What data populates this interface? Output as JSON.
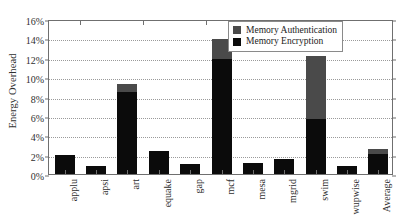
{
  "chart_data": {
    "type": "bar",
    "subtype": "stacked-bar",
    "title": "",
    "xlabel": "",
    "ylabel": "Energy Overhead",
    "categories": [
      "applu",
      "apsi",
      "art",
      "equake",
      "gap",
      "mcf",
      "mesa",
      "mgrid",
      "swim",
      "wupwise",
      "Average"
    ],
    "series": [
      {
        "name": "Memory Encryption",
        "color": "#0b0b0b",
        "values": [
          2.0,
          0.8,
          8.5,
          2.4,
          1.0,
          11.9,
          1.1,
          1.6,
          5.7,
          0.8,
          2.1
        ]
      },
      {
        "name": "Memory Authentication",
        "color": "#4a4a4a",
        "values": [
          0.0,
          0.0,
          0.8,
          0.0,
          0.0,
          2.0,
          0.0,
          0.0,
          6.5,
          0.0,
          0.5
        ]
      }
    ],
    "totals": [
      2.0,
      0.8,
      9.3,
      2.4,
      1.0,
      13.9,
      1.1,
      1.6,
      12.2,
      0.8,
      2.6
    ],
    "ylim": [
      0,
      16
    ],
    "ytick_values": [
      0,
      2,
      4,
      6,
      8,
      10,
      12,
      14,
      16
    ],
    "ytick_labels": [
      "0%",
      "2%",
      "4%",
      "6%",
      "8%",
      "10%",
      "12%",
      "14%",
      "16%"
    ],
    "grid": true,
    "grid_style": "dotted",
    "legend_position": "upper right",
    "legend_entries": [
      {
        "label": "Memory Authentication",
        "color": "#4a4a4a"
      },
      {
        "label": "Memory Encryption",
        "color": "#0b0b0b"
      }
    ]
  },
  "axis": {
    "y_title": "Energy Overhead"
  }
}
